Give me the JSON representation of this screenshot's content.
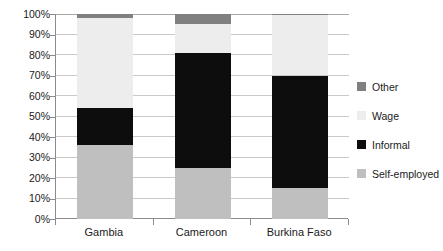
{
  "chart_data": {
    "type": "bar",
    "subtype": "stacked-bar-100-percent",
    "title": "",
    "xlabel": "",
    "ylabel": "",
    "categories": [
      "Gambia",
      "Cameroon",
      "Burkina Faso"
    ],
    "series": [
      {
        "name": "Self-employed",
        "color": "#bfbfbf",
        "values": [
          36,
          25,
          15
        ]
      },
      {
        "name": "Informal",
        "color": "#0d0d0d",
        "values": [
          18,
          56,
          55
        ]
      },
      {
        "name": "Wage",
        "color": "#ededed",
        "values": [
          44,
          14,
          29.5
        ]
      },
      {
        "name": "Other",
        "color": "#808080",
        "values": [
          2,
          5,
          0.5
        ]
      }
    ],
    "stack_order_bottom_to_top": [
      "Self-employed",
      "Informal",
      "Wage",
      "Other"
    ],
    "ylim": [
      0,
      100
    ],
    "y_ticks": [
      0,
      10,
      20,
      30,
      40,
      50,
      60,
      70,
      80,
      90,
      100
    ],
    "y_tick_labels": [
      "0%",
      "10%",
      "20%",
      "30%",
      "40%",
      "50%",
      "60%",
      "70%",
      "80%",
      "90%",
      "100%"
    ],
    "grid": true,
    "grid_axis": "y",
    "legend_position": "right",
    "legend_order_top_to_bottom": [
      "Other",
      "Wage",
      "Informal",
      "Self-employed"
    ],
    "cumulative_tops": {
      "Gambia": {
        "Self-employed": 36,
        "Informal": 54,
        "Wage": 98,
        "Other": 100
      },
      "Cameroon": {
        "Self-employed": 25,
        "Informal": 81,
        "Wage": 95,
        "Other": 100
      },
      "Burkina Faso": {
        "Self-employed": 15,
        "Informal": 70,
        "Wage": 99.5,
        "Other": 100
      }
    }
  },
  "axis": {
    "y_tick_labels": [
      "100%",
      "90%",
      "80%",
      "70%",
      "60%",
      "50%",
      "40%",
      "30%",
      "20%",
      "10%",
      "0%"
    ]
  },
  "legend": {
    "items": [
      {
        "label": "Other",
        "color": "#808080"
      },
      {
        "label": "Wage",
        "color": "#ededed"
      },
      {
        "label": "Informal",
        "color": "#0d0d0d"
      },
      {
        "label": "Self-employed",
        "color": "#bfbfbf"
      }
    ]
  },
  "colors": {
    "self_employed": "#bfbfbf",
    "informal": "#0d0d0d",
    "wage": "#ededed",
    "other": "#808080",
    "gridline": "#c9c9c9",
    "axis": "#8c8c8c",
    "text": "#1a1a1a",
    "background": "#ffffff"
  }
}
